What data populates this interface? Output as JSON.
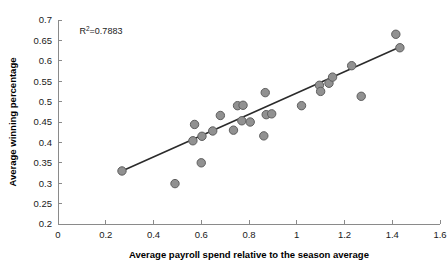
{
  "chart_data": {
    "type": "scatter",
    "title": "",
    "xlabel": "Average payroll spend relative to the season average",
    "ylabel": "Average winning percentage",
    "xlim": [
      0,
      1.6
    ],
    "ylim": [
      0.2,
      0.7
    ],
    "xticks": [
      "0",
      "0.2",
      "0.4",
      "0.6",
      "0.8",
      "1",
      "1.2",
      "1.4",
      "1.6"
    ],
    "xtick_values": [
      0,
      0.2,
      0.4,
      0.6,
      0.8,
      1.0,
      1.2,
      1.4,
      1.6
    ],
    "yticks": [
      "0.2",
      "0.25",
      "0.3",
      "0.35",
      "0.4",
      "0.45",
      "0.5",
      "0.55",
      "0.6",
      "0.65",
      "0.7"
    ],
    "ytick_values": [
      0.2,
      0.25,
      0.3,
      0.35,
      0.4,
      0.45,
      0.5,
      0.55,
      0.6,
      0.65,
      0.7
    ],
    "grid": false,
    "legend": null,
    "annotations": [
      {
        "name": "r-squared",
        "prefix": "R",
        "superscript": "2",
        "suffix": "=0.7883",
        "text": "R2=0.7883",
        "x": 0.09,
        "y": 0.665
      }
    ],
    "marker_color": "#919191",
    "marker_edge_color": "#5e5e5e",
    "marker_radius_px": 4.2,
    "trendline": {
      "name": "linear-fit",
      "color": "#2b2b2b",
      "x_start": 0.268,
      "y_start": 0.33,
      "x_end": 1.432,
      "y_end": 0.634
    },
    "points": [
      {
        "x": 0.268,
        "y": 0.33
      },
      {
        "x": 0.49,
        "y": 0.299
      },
      {
        "x": 0.565,
        "y": 0.404
      },
      {
        "x": 0.572,
        "y": 0.444
      },
      {
        "x": 0.6,
        "y": 0.35
      },
      {
        "x": 0.603,
        "y": 0.415
      },
      {
        "x": 0.648,
        "y": 0.428
      },
      {
        "x": 0.68,
        "y": 0.466
      },
      {
        "x": 0.735,
        "y": 0.43
      },
      {
        "x": 0.752,
        "y": 0.49
      },
      {
        "x": 0.77,
        "y": 0.453
      },
      {
        "x": 0.775,
        "y": 0.491
      },
      {
        "x": 0.805,
        "y": 0.45
      },
      {
        "x": 0.862,
        "y": 0.416
      },
      {
        "x": 0.868,
        "y": 0.522
      },
      {
        "x": 0.872,
        "y": 0.468
      },
      {
        "x": 0.895,
        "y": 0.47
      },
      {
        "x": 1.02,
        "y": 0.49
      },
      {
        "x": 1.095,
        "y": 0.54
      },
      {
        "x": 1.1,
        "y": 0.525
      },
      {
        "x": 1.135,
        "y": 0.545
      },
      {
        "x": 1.15,
        "y": 0.56
      },
      {
        "x": 1.23,
        "y": 0.588
      },
      {
        "x": 1.27,
        "y": 0.513
      },
      {
        "x": 1.415,
        "y": 0.665
      },
      {
        "x": 1.432,
        "y": 0.632
      }
    ]
  }
}
